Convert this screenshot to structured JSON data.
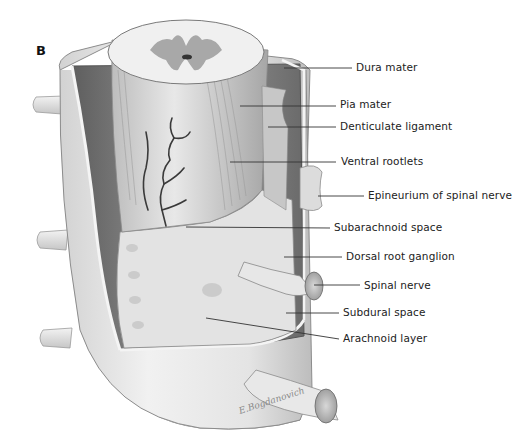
{
  "figure": {
    "panel_letter": "B",
    "colors": {
      "background": "#ffffff",
      "dura_outer": "#e6e6e6",
      "dura_inner": "#7a7a7a",
      "cord_white": "#ececec",
      "gray_matter": "#a8a8a8",
      "leader_line": "#333333",
      "text": "#222222"
    },
    "labels": [
      {
        "id": "dura-mater",
        "text": "Dura mater",
        "x": 356,
        "y": 61,
        "line": [
          [
            284,
            68
          ],
          [
            352,
            68
          ]
        ]
      },
      {
        "id": "pia-mater",
        "text": "Pia mater",
        "x": 340,
        "y": 98,
        "line": [
          [
            240,
            106
          ],
          [
            336,
            106
          ]
        ]
      },
      {
        "id": "denticulate-ligament",
        "text": "Denticulate ligament",
        "x": 340,
        "y": 120,
        "line": [
          [
            268,
            127
          ],
          [
            336,
            127
          ]
        ]
      },
      {
        "id": "ventral-rootlets",
        "text": "Ventral rootlets",
        "x": 341,
        "y": 155,
        "line": [
          [
            230,
            162
          ],
          [
            336,
            162
          ]
        ]
      },
      {
        "id": "epineurium",
        "text": "Epineurium of spinal nerve",
        "x": 368,
        "y": 189,
        "line": [
          [
            318,
            196
          ],
          [
            364,
            196
          ]
        ]
      },
      {
        "id": "subarachnoid-space",
        "text": "Subarachnoid space",
        "x": 334,
        "y": 221,
        "line": [
          [
            186,
            227
          ],
          [
            330,
            228
          ]
        ]
      },
      {
        "id": "dorsal-root-ganglion",
        "text": "Dorsal root ganglion",
        "x": 346,
        "y": 250,
        "line": [
          [
            284,
            257
          ],
          [
            342,
            257
          ]
        ]
      },
      {
        "id": "spinal-nerve",
        "text": "Spinal nerve",
        "x": 364,
        "y": 279,
        "line": [
          [
            314,
            285
          ],
          [
            360,
            285
          ]
        ]
      },
      {
        "id": "subdural-space",
        "text": "Subdural space",
        "x": 343,
        "y": 306,
        "line": [
          [
            286,
            313
          ],
          [
            339,
            313
          ]
        ]
      },
      {
        "id": "arachnoid-layer",
        "text": "Arachnoid layer",
        "x": 343,
        "y": 332,
        "line": [
          [
            206,
            318
          ],
          [
            339,
            339
          ]
        ]
      }
    ],
    "signature": "E.Bogdanovich"
  }
}
